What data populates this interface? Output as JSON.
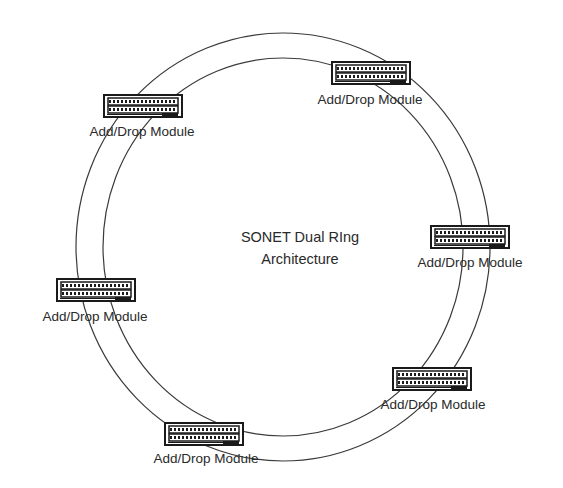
{
  "diagram": {
    "title_line1": "SONET Dual RIng",
    "title_line2": "Architecture",
    "ring": {
      "outer": {
        "cx": 283,
        "cy": 247,
        "rx": 207,
        "ry": 214
      },
      "inner": {
        "cx": 283,
        "cy": 247,
        "rx": 180,
        "ry": 189
      },
      "stroke": "#3a3a3a"
    },
    "modules": [
      {
        "id": "top-left",
        "label": "Add/Drop Module",
        "x": 104,
        "y": 95
      },
      {
        "id": "top-right",
        "label": "Add/Drop Module",
        "x": 332,
        "y": 62
      },
      {
        "id": "right",
        "label": "Add/Drop Module",
        "x": 431,
        "y": 226
      },
      {
        "id": "left",
        "label": "Add/Drop Module",
        "x": 57,
        "y": 279
      },
      {
        "id": "bottom-right",
        "label": "Add/Drop Module",
        "x": 393,
        "y": 368
      },
      {
        "id": "bottom",
        "label": "Add/Drop Module",
        "x": 165,
        "y": 423
      }
    ]
  }
}
